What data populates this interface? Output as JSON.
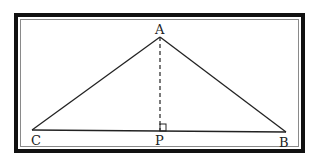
{
  "diagram": {
    "type": "geometry-triangle",
    "labels": {
      "A": "A",
      "B": "B",
      "C": "C",
      "P": "P"
    },
    "points": {
      "A": [
        160,
        37
      ],
      "C": [
        32,
        130
      ],
      "B": [
        286,
        132
      ],
      "P": [
        160,
        131
      ]
    },
    "segments": [
      {
        "from": "A",
        "to": "C",
        "style": "solid"
      },
      {
        "from": "A",
        "to": "B",
        "style": "solid"
      },
      {
        "from": "C",
        "to": "B",
        "style": "solid"
      },
      {
        "from": "A",
        "to": "P",
        "style": "dashed"
      }
    ],
    "right_angle_marker": "P",
    "colors": {
      "line": "#222222",
      "frame": "#111111",
      "frame_inner": "#8a8a8a",
      "background": "#ffffff"
    }
  }
}
